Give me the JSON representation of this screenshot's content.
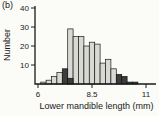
{
  "figure": {
    "panel_label": "(b)",
    "background": "#fbfbf8",
    "text_color": "#1a1a1a",
    "axis_color": "#1a1a1a"
  },
  "chart_data": {
    "type": "bar",
    "subtype": "histogram",
    "title": "",
    "xlabel": "Lower mandible length (mm)",
    "ylabel": "Number",
    "xticks": [
      6,
      8.5,
      11
    ],
    "xtick_labels": [
      "6",
      "8.5",
      "11"
    ],
    "yticks": [
      10,
      20,
      30,
      40
    ],
    "ytick_labels": [
      "10",
      "20",
      "30",
      "40"
    ],
    "xlim": [
      5.85,
      11.4
    ],
    "ylim": [
      0,
      41
    ],
    "grid": false,
    "legend_position": "none",
    "bin_width_mm": 0.25,
    "bin_centers": [
      6.25,
      6.5,
      6.75,
      7.0,
      7.25,
      7.5,
      7.75,
      8.0,
      8.25,
      8.5,
      8.75,
      9.0,
      9.25,
      9.5,
      9.75,
      10.0,
      10.25,
      10.5
    ],
    "series": [
      {
        "name": "light-gray-bars",
        "color": "#d9d9d4",
        "outline": "#1a1a1a",
        "values": [
          1,
          2,
          4,
          6,
          0,
          29,
          25,
          25,
          20,
          22,
          21,
          11,
          13,
          8,
          0,
          0,
          0,
          0
        ]
      },
      {
        "name": "dark-bars",
        "color": "#3d3d3d",
        "outline": "#111111",
        "values": [
          0,
          0,
          0,
          0,
          8,
          3,
          0,
          0,
          0,
          0,
          0,
          0,
          0,
          0,
          5,
          4,
          1,
          1
        ]
      }
    ]
  }
}
